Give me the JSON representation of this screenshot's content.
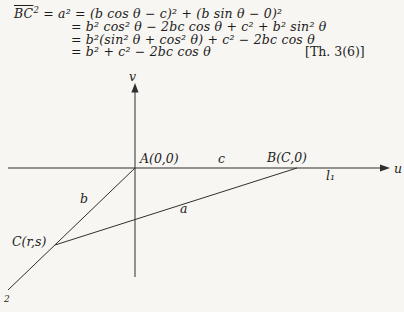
{
  "equations": {
    "bc_base": "BC",
    "bc_sup": "2",
    "line1_rest": " = a² = (b cos θ − c)² + (b sin θ − 0)²",
    "line2": "= b² cos² θ − 2bc cos θ + c² + b² sin² θ",
    "line3": "= b²(sin² θ + cos² θ) + c² − 2bc cos θ",
    "line4": "= b² + c² − 2bc cos θ",
    "theorem_ref": "[Th. 3(6)]"
  },
  "diagram": {
    "v_axis_label": "v",
    "u_axis_label": "u",
    "origin_label": "A(0,0)",
    "b_point_label": "B(C,0)",
    "c_point_label": "C(r,s)",
    "side_a_label": "a",
    "side_b_label": "b",
    "side_c_label": "c",
    "line1_label": "l₁",
    "line2_partial_label": "2"
  },
  "colors": {
    "paper": "#f7f6f2",
    "ink": "#1c1c1c",
    "line": "#2f2f2f"
  }
}
